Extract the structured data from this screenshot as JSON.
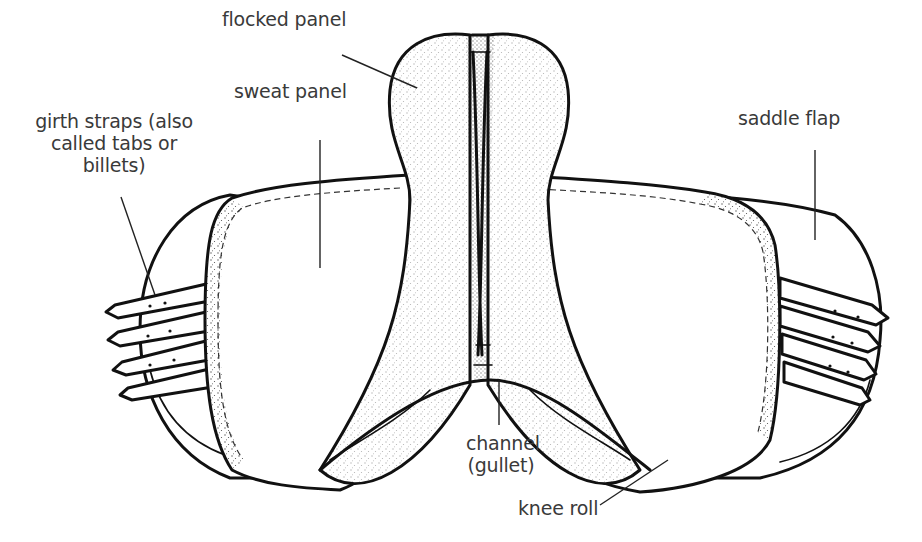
{
  "diagram": {
    "colors": {
      "line": "#111111",
      "label_text": "#3a3a3a",
      "background": "#ffffff"
    },
    "labels": {
      "flocked_panel": "flocked panel",
      "sweat_panel": "sweat panel",
      "girth_straps": "girth straps (also\ncalled tabs or\nbillets)",
      "saddle_flap": "saddle flap",
      "channel": "channel\n(gullet)",
      "knee_roll": "knee roll"
    }
  }
}
